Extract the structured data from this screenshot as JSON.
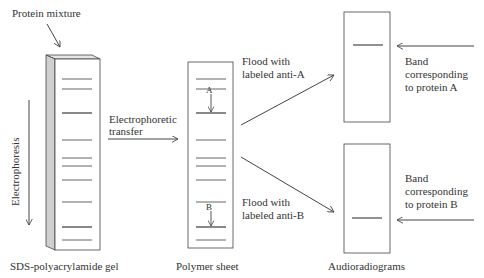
{
  "diagram": {
    "labels": {
      "protein_mixture": "Protein mixture",
      "electrophoresis": "Electrophoresis",
      "electrophoretic_transfer_line1": "Electrophoretic",
      "electrophoretic_transfer_line2": "transfer",
      "flood_a_line1": "Flood with",
      "flood_a_line2": "labeled anti-A",
      "flood_b_line1": "Flood with",
      "flood_b_line2": "labeled anti-B",
      "band_a_line1": "Band",
      "band_a_line2": "corresponding",
      "band_a_line3": "to protein A",
      "band_b_line1": "Band",
      "band_b_line2": "corresponding",
      "band_b_line3": "to protein B",
      "marker_a": "A",
      "marker_b": "B"
    },
    "captions": {
      "gel": "SDS-polyacrylamide gel",
      "sheet": "Polymer sheet",
      "autoradiograms": "Audioradiograms"
    },
    "gel_band_positions_y": [
      79,
      89,
      113,
      140,
      158,
      166,
      180,
      202,
      227,
      240
    ],
    "sheet_band_positions_y": [
      79,
      89,
      113,
      140,
      158,
      166,
      180,
      202,
      227,
      240
    ],
    "autoradiogram_a_band_y": 45,
    "autoradiogram_b_band_y": 218,
    "colors": {
      "line": "#444444",
      "band": "#555555",
      "gel_side": "#cfcfcf",
      "gel_top": "#e6e6e6"
    }
  }
}
